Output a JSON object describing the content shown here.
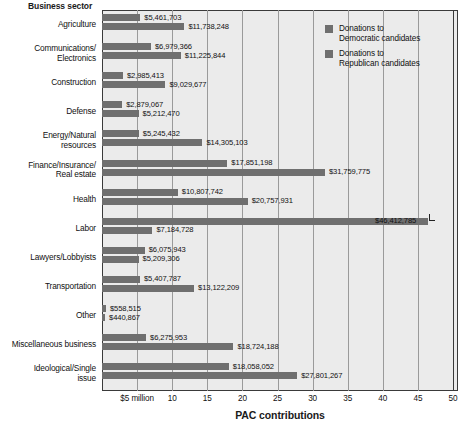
{
  "chart_data": {
    "type": "bar",
    "orientation": "horizontal",
    "title": "",
    "xlabel": "PAC contributions",
    "ylabel": "Business sector",
    "xlim": [
      0,
      50
    ],
    "xunit": "millions of dollars",
    "grid": true,
    "legend_position": "top-right",
    "xticks": [
      {
        "value": 5,
        "label": "$5 million"
      },
      {
        "value": 10,
        "label": "10"
      },
      {
        "value": 15,
        "label": "15"
      },
      {
        "value": 20,
        "label": "20"
      },
      {
        "value": 25,
        "label": "25"
      },
      {
        "value": 30,
        "label": "30"
      },
      {
        "value": 35,
        "label": "35"
      },
      {
        "value": 40,
        "label": "40"
      },
      {
        "value": 45,
        "label": "45"
      },
      {
        "value": 50,
        "label": "50"
      }
    ],
    "categories": [
      "Agriculture",
      "Communications/ Electronics",
      "Construction",
      "Defense",
      "Energy/Natural resources",
      "Finance/Insurance/ Real estate",
      "Health",
      "Labor",
      "Lawyers/Lobbyists",
      "Transportation",
      "Other",
      "Miscellaneous business",
      "Ideological/Single issue"
    ],
    "series": [
      {
        "name": "Donations to Democratic candidates",
        "color": "#6f6f6f",
        "values": [
          5461703,
          6979366,
          2985413,
          2879067,
          5245432,
          17851198,
          10807742,
          46412785,
          6075943,
          5407787,
          558515,
          6275953,
          18058052
        ],
        "labels": [
          "$5,461,703",
          "$6,979,366",
          "$2,985,413",
          "$2,879,067",
          "$5,245,432",
          "$17,851,198",
          "$10,807,742",
          "$46,412,785",
          "$6,075,943",
          "$5,407,787",
          "$558,515",
          "$6,275,953",
          "$18,058,052"
        ]
      },
      {
        "name": "Donations to Republican candidates",
        "color": "#6f6f6f",
        "values": [
          11738248,
          11225844,
          9029677,
          5212470,
          14305103,
          31759775,
          20757931,
          7184728,
          5209306,
          13122209,
          440867,
          18724188,
          27801267
        ],
        "labels": [
          "$11,738,248",
          "$11,225,844",
          "$9,029,677",
          "$5,212,470",
          "$14,305,103",
          "$31,759,775",
          "$20,757,931",
          "$7,184,728",
          "$5,209,306",
          "$13,122,209",
          "$440,867",
          "$18,724,188",
          "$27,801,267"
        ]
      }
    ]
  },
  "axis": {
    "y_title": "Business sector",
    "x_title": "PAC contributions"
  },
  "legend": {
    "items": [
      {
        "line1": "Donations to",
        "line2": "Democratic candidates"
      },
      {
        "line1": "Donations to",
        "line2": "Republican candidates"
      }
    ]
  },
  "labels": {
    "cat_0_line1": "Agriculture",
    "cat_0_line2": "",
    "cat_1_line1": "Communications/",
    "cat_1_line2": "Electronics",
    "cat_2_line1": "Construction",
    "cat_2_line2": "",
    "cat_3_line1": "Defense",
    "cat_3_line2": "",
    "cat_4_line1": "Energy/Natural",
    "cat_4_line2": "resources",
    "cat_5_line1": "Finance/Insurance/",
    "cat_5_line2": "Real estate",
    "cat_6_line1": "Health",
    "cat_6_line2": "",
    "cat_7_line1": "Labor",
    "cat_7_line2": "",
    "cat_8_line1": "Lawyers/Lobbyists",
    "cat_8_line2": "",
    "cat_9_line1": "Transportation",
    "cat_9_line2": "",
    "cat_10_line1": "Other",
    "cat_10_line2": "",
    "cat_11_line1": "Miscellaneous business",
    "cat_11_line2": "",
    "cat_12_line1": "Ideological/Single",
    "cat_12_line2": "issue"
  }
}
